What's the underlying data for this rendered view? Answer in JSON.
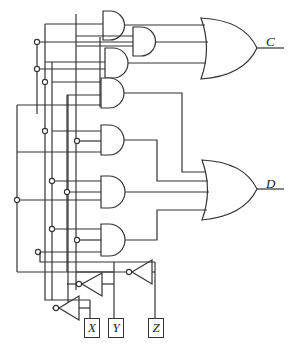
{
  "diagram": {
    "type": "combinational logic circuit",
    "inputs": [
      {
        "name": "X",
        "x": 84,
        "y": 318
      },
      {
        "name": "Y",
        "x": 108,
        "y": 318
      },
      {
        "name": "Z",
        "x": 148,
        "y": 318
      }
    ],
    "outputs": [
      {
        "name": "C",
        "x": 266,
        "y": 34
      },
      {
        "name": "D",
        "x": 266,
        "y": 176
      }
    ],
    "gates": {
      "and_count": 7,
      "or_count": 2,
      "not_count": 3
    }
  }
}
